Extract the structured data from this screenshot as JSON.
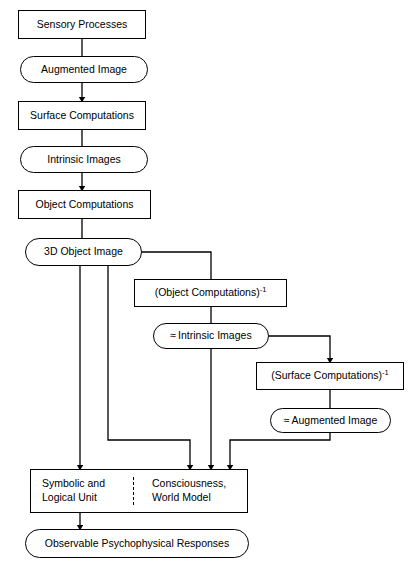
{
  "diagram": {
    "stroke_color": "#000000",
    "background_color": "#ffffff",
    "nodes": [
      {
        "id": "sensory_processes",
        "label": "Sensory Processes",
        "shape": "rect",
        "x": 18,
        "y": 10,
        "w": 128,
        "h": 29
      },
      {
        "id": "augmented_image",
        "label": "Augmented Image",
        "shape": "stadium",
        "x": 20,
        "y": 56,
        "w": 128,
        "h": 27
      },
      {
        "id": "surface_computations",
        "label": "Surface Computations",
        "shape": "rect",
        "x": 18,
        "y": 101,
        "w": 128,
        "h": 29
      },
      {
        "id": "intrinsic_images",
        "label": "Intrinsic Images",
        "shape": "stadium",
        "x": 20,
        "y": 146,
        "w": 128,
        "h": 27
      },
      {
        "id": "object_computations",
        "label": "Object Computations",
        "shape": "rect",
        "x": 18,
        "y": 190,
        "w": 133,
        "h": 29
      },
      {
        "id": "three_d_object_image",
        "label": "3D Object Image",
        "shape": "stadium",
        "x": 25,
        "y": 238,
        "w": 117,
        "h": 28
      },
      {
        "id": "object_computations_inv",
        "label": "(Object Computations)",
        "superscript": "-1",
        "shape": "rect",
        "x": 134,
        "y": 279,
        "w": 153,
        "h": 28
      },
      {
        "id": "approx_intrinsic_images",
        "label": "Intrinsic Images",
        "approx": "≈",
        "shape": "stadium",
        "x": 153,
        "y": 323,
        "w": 116,
        "h": 26
      },
      {
        "id": "surface_computations_inv",
        "label": "(Surface Computations)",
        "superscript": "-1",
        "shape": "rect",
        "x": 256,
        "y": 362,
        "w": 148,
        "h": 28
      },
      {
        "id": "approx_augmented_image",
        "label": "Augmented Image",
        "approx": "≈",
        "shape": "stadium",
        "x": 270,
        "y": 408,
        "w": 121,
        "h": 25
      },
      {
        "id": "observable_responses",
        "label": "Observable Psychophysical Responses",
        "shape": "stadium",
        "x": 25,
        "y": 529,
        "w": 224,
        "h": 29
      }
    ],
    "split_node": {
      "id": "symbolic_consciousness",
      "x": 30,
      "y": 469,
      "w": 218,
      "h": 44,
      "divider_x": 132,
      "left_label": "Symbolic and\nLogical Unit",
      "right_label": "Consciousness,\nWorld Model"
    },
    "edges": [
      {
        "id": "e1",
        "from": "sensory_processes",
        "to": "augmented_image",
        "arrow": false
      },
      {
        "id": "e2",
        "from": "augmented_image",
        "to": "surface_computations",
        "arrow": true
      },
      {
        "id": "e3",
        "from": "surface_computations",
        "to": "intrinsic_images",
        "arrow": false
      },
      {
        "id": "e4",
        "from": "intrinsic_images",
        "to": "object_computations",
        "arrow": true
      },
      {
        "id": "e5",
        "from": "object_computations",
        "to": "three_d_object_image",
        "arrow": false
      },
      {
        "id": "e6",
        "from": "three_d_object_image",
        "to": "object_computations_inv",
        "arrow": false
      },
      {
        "id": "e7",
        "from": "object_computations_inv",
        "to": "approx_intrinsic_images",
        "arrow": false
      },
      {
        "id": "e8",
        "from": "approx_intrinsic_images",
        "to": "surface_computations_inv",
        "arrow": true
      },
      {
        "id": "e9",
        "from": "surface_computations_inv",
        "to": "approx_augmented_image",
        "arrow": false
      },
      {
        "id": "e10",
        "from": "three_d_object_image",
        "to": "symbolic_left_cell",
        "arrow": true
      },
      {
        "id": "e11",
        "from": "three_d_object_image",
        "to": "symbolic_right_cell",
        "arrow": true
      },
      {
        "id": "e12",
        "from": "approx_intrinsic_images",
        "to": "symbolic_right_cell",
        "arrow": true
      },
      {
        "id": "e13",
        "from": "approx_augmented_image",
        "to": "symbolic_right_cell",
        "arrow": true
      },
      {
        "id": "e14",
        "from": "symbolic_consciousness",
        "to": "observable_responses",
        "arrow": true
      }
    ]
  }
}
